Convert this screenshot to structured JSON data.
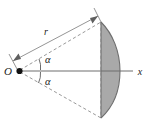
{
  "figure": {
    "background_color": "#ffffff",
    "labels": {
      "origin": "O",
      "radius": "r",
      "axis": "x",
      "angle_upper": "α",
      "angle_lower": "α"
    },
    "colors": {
      "cap_fill": "#a9a9a9",
      "cap_stroke": "#6e6e6e",
      "axis_stroke": "#6f6f6f",
      "dashed_stroke": "#8d8d8d",
      "dimension_stroke": "#7a7a7a",
      "label_color": "#1a1a1a",
      "vertex_dot": "#111111"
    },
    "geometry": {
      "origin_point": [
        19,
        71
      ],
      "axis_end": [
        133,
        71
      ],
      "cap_chord_x": 101,
      "cap_top": [
        101,
        22
      ],
      "cap_bottom": [
        101,
        118
      ],
      "cap_apex": [
        120,
        71
      ],
      "radius_dimension_from": [
        13,
        62
      ],
      "radius_dimension_to": [
        98,
        17
      ],
      "half_angle_degrees": 27
    },
    "elements": [
      "x-axis with arrow-free terminal and label x",
      "origin point O with filled dot",
      "two dashed cone generator lines from O to cap edges",
      "dashed chord line closing the cone at the cap base",
      "shaded spherical cap (lens) bulging to the right",
      "dimension line with arrowheads at both ends labelled r",
      "two angle arcs each labelled alpha"
    ]
  }
}
